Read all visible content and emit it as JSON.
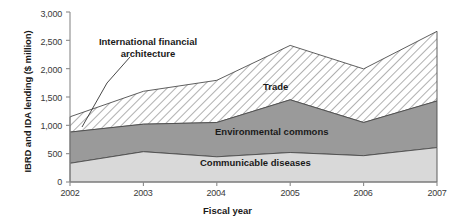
{
  "chart_data": {
    "type": "area",
    "stacked": true,
    "title": "",
    "xlabel": "Fiscal year",
    "ylabel": "IBRD and IDA lending ($ million)",
    "categories": [
      "2002",
      "2003",
      "2004",
      "2005",
      "2006",
      "2007"
    ],
    "x": [
      2002,
      2003,
      2004,
      2005,
      2006,
      2007
    ],
    "ylim": [
      0,
      3000
    ],
    "yticks": [
      "0",
      "500",
      "1,000",
      "1,500",
      "2,000",
      "2,500",
      "3,000"
    ],
    "ytick_values": [
      0,
      500,
      1000,
      1500,
      2000,
      2500,
      3000
    ],
    "grid": false,
    "legend": "in-plot-annotations",
    "series": [
      {
        "name": "Communicable diseases",
        "fill": "#d9d9d9",
        "values": [
          330,
          535,
          445,
          520,
          465,
          607
        ]
      },
      {
        "name": "Environmental commons",
        "fill": "#9a9a9a",
        "values": [
          550,
          485,
          605,
          930,
          585,
          823
        ]
      },
      {
        "name": "Trade",
        "fill": "hatched",
        "values": [
          270,
          580,
          745,
          960,
          945,
          1230
        ]
      }
    ],
    "cumulative_totals": [
      1150,
      1600,
      1795,
      2410,
      1995,
      2660
    ],
    "annotations": [
      {
        "name": "international-financial-architecture",
        "text_line1": "International financial",
        "text_line2": "architecture",
        "points_to_year": 2002,
        "points_to_value": 1000
      },
      {
        "name": "trade",
        "text": "Trade"
      },
      {
        "name": "environmental-commons",
        "text": "Environmental commons"
      },
      {
        "name": "communicable-diseases",
        "text": "Communicable diseases"
      }
    ]
  },
  "axis": {
    "y_title": "IBRD and IDA lending ($ million)",
    "x_title": "Fiscal year",
    "y_labels": [
      "3,000",
      "2,500",
      "2,000",
      "1,500",
      "1,000",
      "500",
      "0"
    ],
    "x_labels": [
      "2002",
      "2003",
      "2004",
      "2005",
      "2006",
      "2007"
    ]
  },
  "labels": {
    "ifa_line1": "International financial",
    "ifa_line2": "architecture",
    "trade": "Trade",
    "environmental": "Environmental commons",
    "communicable": "Communicable diseases"
  },
  "colors": {
    "communicable": "#d9d9d9",
    "environmental": "#9a9a9a",
    "trade_hatch_bg": "#ffffff",
    "trade_hatch_line": "#6e6e6e",
    "axis": "#808080",
    "text": "#1a1a1a"
  }
}
